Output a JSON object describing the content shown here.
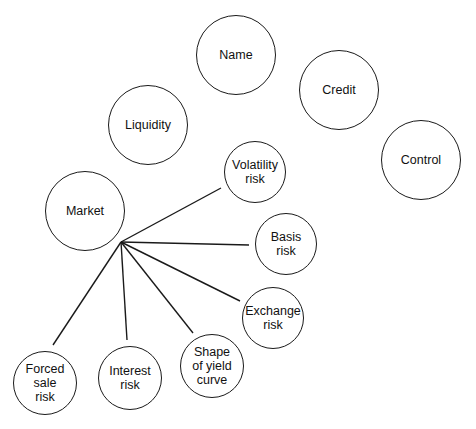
{
  "diagram": {
    "title": "",
    "hub": {
      "x": 121,
      "y": 242
    },
    "top_nodes": [
      {
        "id": "name",
        "label": "Name",
        "cx": 236,
        "cy": 55,
        "r": 40
      },
      {
        "id": "credit",
        "label": "Credit",
        "cx": 339,
        "cy": 90,
        "r": 40
      },
      {
        "id": "liquidity",
        "label": "Liquidity",
        "cx": 148,
        "cy": 125,
        "r": 40
      },
      {
        "id": "control",
        "label": "Control",
        "cx": 421,
        "cy": 160,
        "r": 40
      },
      {
        "id": "market",
        "label": "Market",
        "cx": 85,
        "cy": 211,
        "r": 40
      }
    ],
    "market_children": [
      {
        "id": "volatility-risk",
        "label": "Volatility\nrisk",
        "cx": 255,
        "cy": 172,
        "r": 31,
        "line_end": [
          221,
          188
        ]
      },
      {
        "id": "basis-risk",
        "label": "Basis\nrisk",
        "cx": 286,
        "cy": 244,
        "r": 31,
        "line_end": [
          249,
          245
        ]
      },
      {
        "id": "exchange-risk",
        "label": "Exchange\nrisk",
        "cx": 273,
        "cy": 318,
        "r": 31,
        "line_end": [
          240,
          301
        ]
      },
      {
        "id": "shape-of-yield-curve",
        "label": "Shape\nof yield\ncurve",
        "cx": 212,
        "cy": 366,
        "r": 32,
        "line_end": [
          193,
          333
        ]
      },
      {
        "id": "interest-risk",
        "label": "Interest\nrisk",
        "cx": 130,
        "cy": 378,
        "r": 32,
        "line_end": [
          127,
          340
        ]
      },
      {
        "id": "forced-sale-risk",
        "label": "Forced\nsale\nrisk",
        "cx": 45,
        "cy": 383,
        "r": 32,
        "line_end": [
          53,
          345
        ]
      }
    ],
    "colors": {
      "stroke": "#1a1a1a",
      "background": "#ffffff",
      "text": "#111111"
    }
  }
}
